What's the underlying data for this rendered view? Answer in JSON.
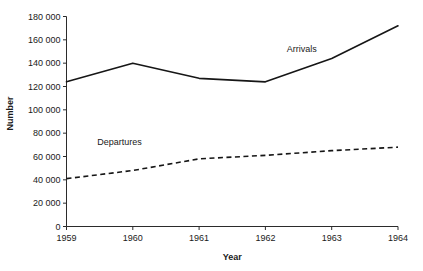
{
  "chart_data": {
    "type": "line",
    "title": "",
    "xlabel": "Year",
    "ylabel": "Number",
    "categories": [
      "1959",
      "1960",
      "1961",
      "1962",
      "1963",
      "1964"
    ],
    "x": [
      1959,
      1960,
      1961,
      1962,
      1963,
      1964
    ],
    "xlim": [
      1959,
      1964
    ],
    "ylim": [
      0,
      180000
    ],
    "ytick_step": 20000,
    "ytick_labels": [
      "0",
      "20 000",
      "40 000",
      "60 000",
      "80 000",
      "100 000",
      "120 000",
      "140 000",
      "160 000",
      "180 000"
    ],
    "ytick_values": [
      0,
      20000,
      40000,
      60000,
      80000,
      100000,
      120000,
      140000,
      160000,
      180000
    ],
    "xtick_labels": [
      "1959",
      "1960",
      "1961",
      "1962",
      "1963",
      "1964"
    ],
    "grid": false,
    "legend_position": "inline-labels",
    "series": [
      {
        "name": "Arrivals",
        "style": "solid",
        "color": "#161616",
        "values": [
          124000,
          140000,
          127000,
          124000,
          144000,
          172000
        ],
        "label_text": "Arrivals"
      },
      {
        "name": "Departures",
        "style": "dashed",
        "color": "#161616",
        "values": [
          41000,
          48000,
          58000,
          61000,
          65000,
          68000
        ],
        "label_text": "Departures"
      }
    ],
    "annotations": [
      {
        "text": "Arrivals",
        "x": 1962.55,
        "y": 150000
      },
      {
        "text": "Departures",
        "x": 1959.8,
        "y": 70000
      }
    ]
  }
}
